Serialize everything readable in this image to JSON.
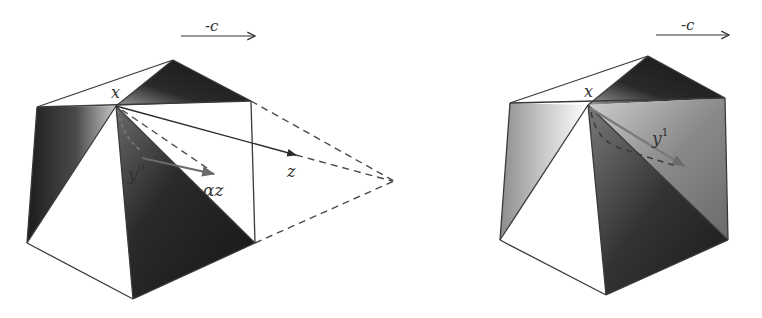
{
  "figure": {
    "colors": {
      "background": "#ffffff",
      "edge": "#3a3a3a",
      "dark_face": "#1e1e1e",
      "mid_face": "#5a5a5a",
      "light_face": "#bdbdbd",
      "arrow_gray": "#6b6b6b"
    },
    "left_panel": {
      "direction_label": "-c",
      "vertex_label": "x",
      "labels": {
        "y": "y",
        "y_sup": "0",
        "alpha_z": "αz",
        "z": "z"
      }
    },
    "right_panel": {
      "direction_label": "-c",
      "vertex_label": "x",
      "labels": {
        "y": "y",
        "y_sup": "1"
      }
    }
  }
}
